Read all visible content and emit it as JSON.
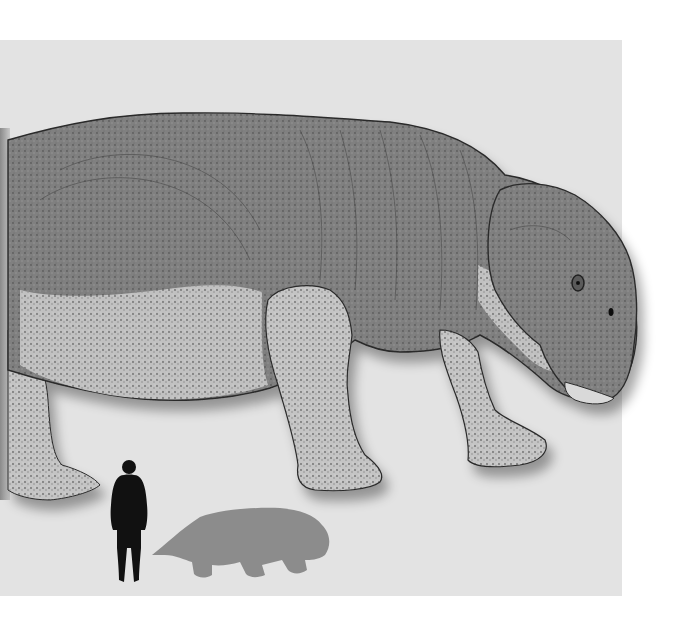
{
  "image": {
    "kind": "paleoart illustration with scale comparison",
    "subject": "large dicynodont-like quadruped (hippo-like body, beaked snout with small tusks)",
    "style": "grayscale stippled pencil illustration",
    "scale_figures": [
      {
        "name": "human silhouette",
        "color": "#111111"
      },
      {
        "name": "animal silhouette",
        "color": "#8c8c8c"
      }
    ]
  },
  "colors": {
    "background": "#ffffff",
    "panel": "#e3e3e3",
    "body_dark": "#7d7d7d",
    "body_light": "#b9b9b9",
    "outline": "#2a2a2a",
    "human_silhouette": "#111111",
    "animal_silhouette": "#8c8c8c"
  }
}
